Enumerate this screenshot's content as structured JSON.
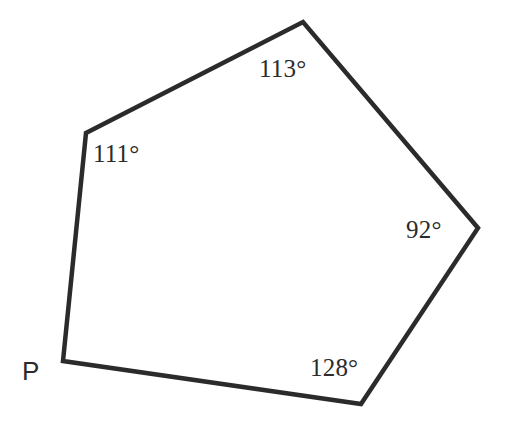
{
  "figure": {
    "type": "geometry-diagram",
    "shape": "pentagon",
    "background_color": "#ffffff",
    "stroke_color": "#2b2b2b",
    "stroke_width": 4.5,
    "canvas": {
      "width": 506,
      "height": 425
    }
  },
  "polygon": {
    "name": "pentagon-outline",
    "fill": "none",
    "points_attr": "63,361 86,133 303,22 478,228 361,404",
    "vertices": [
      {
        "id": "P",
        "x": 63,
        "y": 361,
        "labeled": true,
        "angle_shown": false
      },
      {
        "id": "Q",
        "x": 86,
        "y": 133,
        "labeled": false,
        "angle_shown": true,
        "angle": "111"
      },
      {
        "id": "R",
        "x": 303,
        "y": 22,
        "labeled": false,
        "angle_shown": true,
        "angle": "113"
      },
      {
        "id": "S",
        "x": 478,
        "y": 228,
        "labeled": false,
        "angle_shown": true,
        "angle": "92"
      },
      {
        "id": "T",
        "x": 361,
        "y": 404,
        "labeled": false,
        "angle_shown": true,
        "angle": "128"
      }
    ]
  },
  "labels": {
    "vertex_p": "P",
    "angle_111": "111°",
    "angle_113": "113°",
    "angle_92": "92°",
    "angle_128": "128°"
  },
  "chart_data": {
    "type": "diagram",
    "categories": [
      "111° vertex",
      "113° vertex",
      "92° vertex",
      "128° vertex",
      "P"
    ],
    "values": [
      111,
      113,
      92,
      128,
      null
    ],
    "unit": "degrees",
    "annotations": [
      "111°",
      "113°",
      "92°",
      "128°",
      "P"
    ]
  }
}
